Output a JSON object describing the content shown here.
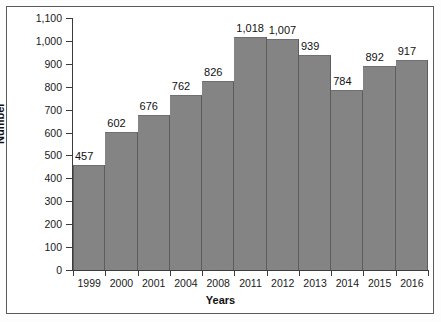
{
  "chart_data": {
    "type": "bar",
    "title": "",
    "xlabel": "Years",
    "ylabel": "Number",
    "categories": [
      "1999",
      "2000",
      "2001",
      "2004",
      "2008",
      "2011",
      "2012",
      "2013",
      "2014",
      "2015",
      "2016"
    ],
    "values": [
      457,
      602,
      676,
      762,
      826,
      1018,
      1007,
      939,
      784,
      892,
      917
    ],
    "value_labels": [
      "457",
      "602",
      "676",
      "762",
      "826",
      "1,018",
      "1,007",
      "939",
      "784",
      "892",
      "917"
    ],
    "ylim": [
      0,
      1100
    ],
    "ytick_values": [
      0,
      100,
      200,
      300,
      400,
      500,
      600,
      700,
      800,
      900,
      1000,
      1100
    ],
    "ytick_labels": [
      "0",
      "100",
      "200",
      "300",
      "400",
      "500",
      "600",
      "700",
      "800",
      "900",
      "1,000",
      "1,100"
    ],
    "grid": false,
    "legend": false,
    "bar_color": "#848484",
    "bar_edge_color": "#5d5d5d",
    "axis_color": "#3c3c3c",
    "text_color": "#111111",
    "background_color": "#ffffff",
    "frame_color": "#5a5a5a"
  }
}
